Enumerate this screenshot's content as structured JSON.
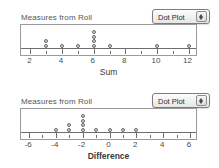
{
  "theme": {
    "background": "#ffffff",
    "frame_border": "#9b9b9b",
    "axis_color": "#6d6d6d",
    "dot_fill": "#d2d2d2",
    "dot_stroke": "#6b6b6b",
    "text_color": "#3a3a3a"
  },
  "panels": [
    {
      "title": "Measures from Roll",
      "dropdown": {
        "value": "Dot Plot",
        "options": [
          "Dot Plot"
        ],
        "stepper_up_icon": "triangle-up-icon",
        "stepper_down_icon": "triangle-down-icon"
      },
      "chart_data": {
        "type": "dotplot",
        "title": "Measures from Roll",
        "xlabel": "Sum",
        "ylabel": "",
        "xlim": [
          1.4,
          12.6
        ],
        "grid": false,
        "legend": "none",
        "major_ticks": [
          2,
          4,
          6,
          8,
          10,
          12
        ],
        "minor_ticks": [
          3,
          5,
          7,
          9,
          11
        ],
        "tick_labels": [
          "2",
          "4",
          "6",
          "8",
          "10",
          "12"
        ],
        "categories": [
          3,
          4,
          5,
          6,
          7,
          10,
          12
        ],
        "values": [
          2,
          1,
          1,
          4,
          1,
          1,
          1
        ],
        "total_count": 11
      }
    },
    {
      "title": "Measures from Roll",
      "dropdown": {
        "value": "Dot Plot",
        "options": [
          "Dot Plot"
        ],
        "stepper_up_icon": "triangle-up-icon",
        "stepper_down_icon": "triangle-down-icon"
      },
      "chart_data": {
        "type": "dotplot",
        "title": "Measures from Roll",
        "xlabel": "Difference",
        "ylabel": "",
        "xlim": [
          -6.6,
          6.6
        ],
        "grid": false,
        "legend": "none",
        "major_ticks": [
          -6,
          -4,
          -2,
          0,
          2,
          4,
          6
        ],
        "minor_ticks": [
          -5,
          -3,
          -1,
          1,
          3,
          5
        ],
        "tick_labels": [
          "-6",
          "-4",
          "-2",
          "0",
          "2",
          "4",
          "6"
        ],
        "categories": [
          -4,
          -3,
          -2,
          -1,
          0,
          1,
          2
        ],
        "values": [
          1,
          2,
          4,
          1,
          1,
          1,
          1
        ],
        "total_count": 11
      }
    }
  ]
}
